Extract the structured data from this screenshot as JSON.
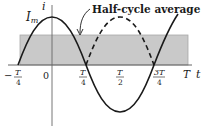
{
  "diagram": {
    "annotation": "Half-cycle average",
    "peak_label": "I",
    "peak_label_sub": "m",
    "y_axis_label": "i",
    "x_axis_label": "t",
    "ticks": [
      {
        "num": "T",
        "den": "4",
        "sign": "−",
        "x": 18
      },
      {
        "plain": "0",
        "x": 48
      },
      {
        "num": "T",
        "den": "4",
        "sign": "",
        "x": 86
      },
      {
        "num": "T",
        "den": "2",
        "sign": "",
        "x": 120
      },
      {
        "num": "3T",
        "den": "4",
        "sign": "",
        "x": 155
      },
      {
        "plain": "T",
        "x": 185
      }
    ],
    "curves": {
      "solid": "sinusoid i = I_m cos(ωt), from −T/4 through T",
      "dashed": "rectified negative half-cycle |i| between T/4 and 3T/4"
    },
    "shaded_region": "rectangle representing half-cycle average value from −T/4 to T",
    "colors": {
      "curve": "#1a1a1a",
      "shade": "#c9c9c9",
      "shade_edge": "#a8a8a8",
      "axis": "#555555"
    }
  }
}
